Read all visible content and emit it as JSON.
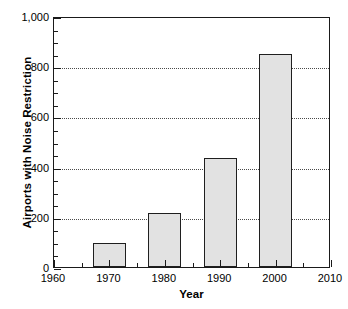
{
  "chart_data": {
    "type": "bar",
    "title": "",
    "xlabel": "Year",
    "ylabel": "Airports with Noise Restriction",
    "categories": [
      "1970",
      "1980",
      "1990",
      "2000"
    ],
    "values": [
      96,
      215,
      434,
      848
    ],
    "x": [
      1970,
      1980,
      1990,
      2000
    ],
    "xlim": [
      1960,
      2010
    ],
    "ylim": [
      0,
      1000
    ],
    "x_tick_labels": [
      "1960",
      "1970",
      "1980",
      "1990",
      "2000",
      "2010"
    ],
    "x_ticks": [
      1960,
      1970,
      1980,
      1990,
      2000,
      2010
    ],
    "x_minor_tick_interval": 5,
    "y_tick_labels": [
      "0",
      "200",
      "400",
      "600",
      "800",
      "1,000"
    ],
    "y_ticks": [
      0,
      200,
      400,
      600,
      800,
      1000
    ],
    "y_minor_tick_interval": 50,
    "gridlines": {
      "horizontal": [
        200,
        400,
        600,
        800
      ],
      "style": "dotted",
      "vertical": []
    },
    "legend": {
      "visible": false,
      "position": "none",
      "entries": []
    },
    "bar_style": {
      "fill_color": "#e2e2e2",
      "edge_color": "#1f1f1f",
      "width_years": 6
    },
    "frame": {
      "visible": true,
      "color": "#1a1a1a"
    },
    "annotations": []
  }
}
